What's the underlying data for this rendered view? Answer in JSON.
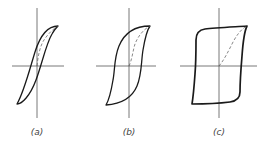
{
  "figure": {
    "type": "hysteresis-loops",
    "panels": [
      {
        "id": "a",
        "label": "(a)",
        "description": "narrow loop, low coercivity"
      },
      {
        "id": "b",
        "label": "(b)",
        "description": "medium loop"
      },
      {
        "id": "c",
        "label": "(c)",
        "description": "square loop, high coercivity"
      }
    ],
    "colors": {
      "curve": "#1a1a1a",
      "axis": "#555555",
      "background": "#ffffff"
    }
  }
}
